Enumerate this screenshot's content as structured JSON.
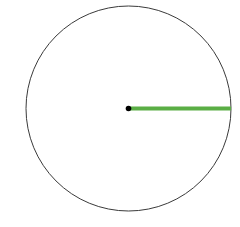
{
  "diagram": {
    "type": "circle-with-radius",
    "circle": {
      "cx": 128.5,
      "cy": 108.5,
      "r": 102.5,
      "stroke": "#3a3a3a",
      "stroke_width": 1,
      "fill": "#ffffff"
    },
    "center_point": {
      "cx": 128.5,
      "cy": 108.5,
      "r": 2.8,
      "fill": "#000000"
    },
    "radius_line": {
      "x1": 128.5,
      "y1": 108.5,
      "x2": 231,
      "y2": 108.5,
      "stroke": "#5aae45",
      "stroke_width": 4
    }
  }
}
